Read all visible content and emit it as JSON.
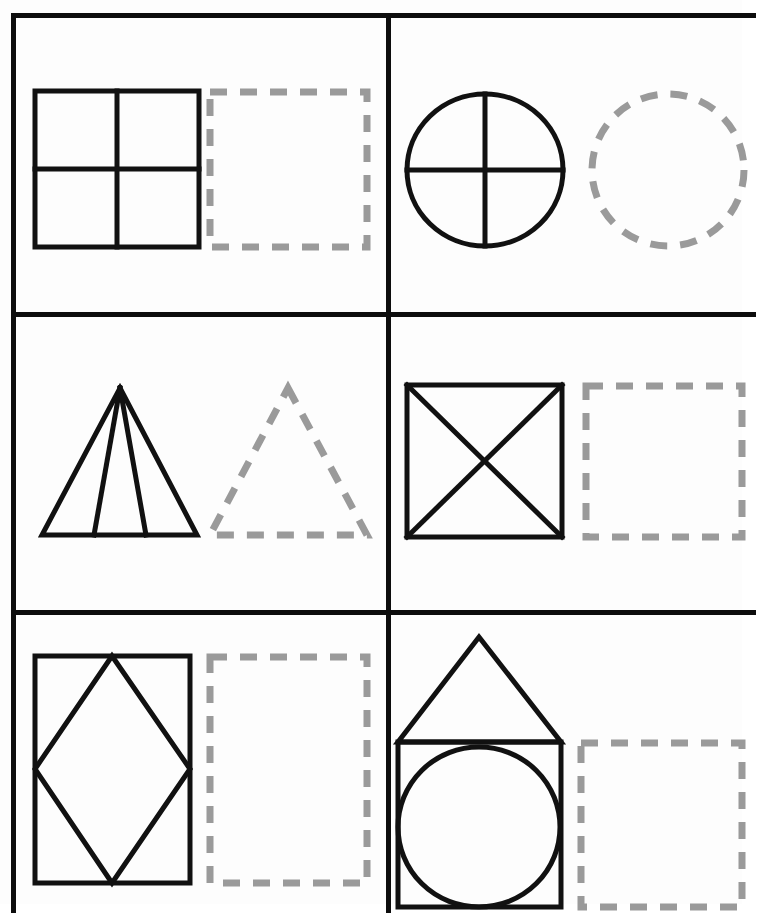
{
  "worksheet": {
    "title": "Shape Halves and Parts Tracing Worksheet",
    "layout": {
      "rows": 3,
      "columns": 2,
      "cell_count": 6,
      "border_color": "#0d0d0d",
      "solid_shape_color": "#111111",
      "dashed_shape_color": "#9a9a9a",
      "background_color": "#fdfdfd"
    },
    "instructions_visible": false
  },
  "cells": [
    {
      "id": "cell-1",
      "position": "row-1-col-1",
      "model_shape": {
        "name": "square-divided-quarters",
        "label": "Square divided into four equal quadrants",
        "divisions": 4,
        "division_type": "one vertical line and one horizontal line"
      },
      "trace_shape": {
        "name": "dashed-square-outline",
        "label": "Dashed square outline to trace",
        "style": "dashed"
      }
    },
    {
      "id": "cell-2",
      "position": "row-1-col-2",
      "model_shape": {
        "name": "circle-divided-quarters",
        "label": "Circle divided into four quarters",
        "divisions": 4,
        "division_type": "vertical and horizontal diameters"
      },
      "trace_shape": {
        "name": "dashed-circle-outline",
        "label": "Dashed circle outline to trace",
        "style": "dashed"
      }
    },
    {
      "id": "cell-3",
      "position": "row-2-col-1",
      "model_shape": {
        "name": "triangle-divided-four",
        "label": "Triangle divided into four parts from the apex",
        "divisions": 4,
        "division_type": "two lines from apex to base"
      },
      "trace_shape": {
        "name": "dashed-triangle-outline",
        "label": "Dashed triangle outline to trace",
        "style": "dashed"
      }
    },
    {
      "id": "cell-4",
      "position": "row-2-col-2",
      "model_shape": {
        "name": "square-with-diagonals",
        "label": "Square divided by both diagonals into four triangles",
        "divisions": 4,
        "division_type": "two diagonals forming an X"
      },
      "trace_shape": {
        "name": "dashed-square-outline",
        "label": "Dashed square outline to trace",
        "style": "dashed"
      }
    },
    {
      "id": "cell-5",
      "position": "row-3-col-1",
      "model_shape": {
        "name": "rectangle-with-inscribed-diamond",
        "label": "Rectangle containing an inscribed diamond (rhombus)",
        "divisions": 5,
        "division_type": "rhombus joining midpoints of the rectangle sides"
      },
      "trace_shape": {
        "name": "dashed-rectangle-outline",
        "label": "Dashed rectangle outline to trace",
        "style": "dashed"
      }
    },
    {
      "id": "cell-6",
      "position": "row-3-col-2",
      "model_shape": {
        "name": "house-square-triangle-circle",
        "label": "House shape: triangle roof on a square with an inscribed circle",
        "divisions": 3,
        "division_type": "triangle above square, circle inscribed in square"
      },
      "trace_shape": {
        "name": "dashed-square-outline",
        "label": "Dashed square outline to trace",
        "style": "dashed"
      }
    }
  ]
}
